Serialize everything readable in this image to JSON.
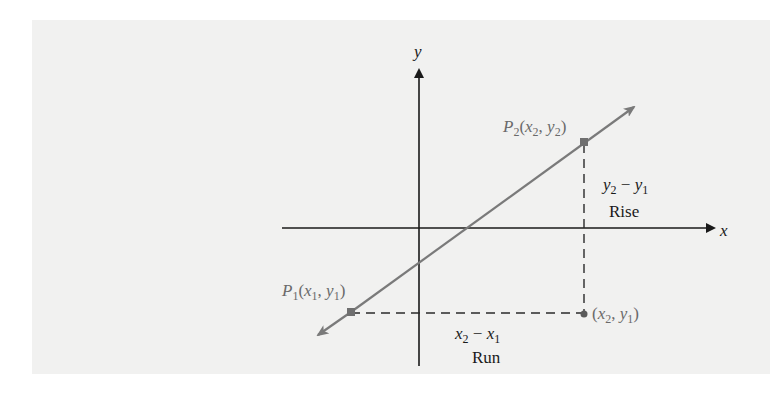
{
  "diagram": {
    "background_color": "#f1f1f0",
    "line_color": "#7a7a7a",
    "axes": {
      "x_label": "x",
      "y_label": "y"
    },
    "points": {
      "p1": {
        "label_main": "P",
        "label_sub": "1",
        "coords_text": "(x",
        "coord1_sub": "1",
        "sep": ", y",
        "coord2_sub": "1",
        "close": ")"
      },
      "p2": {
        "label_main": "P",
        "label_sub": "2",
        "coords_text": "(x",
        "coord1_sub": "2",
        "sep": ", y",
        "coord2_sub": "2",
        "close": ")"
      },
      "corner": {
        "coords_text": "(x",
        "coord1_sub": "2",
        "sep": ", y",
        "coord2_sub": "1",
        "close": ")"
      }
    },
    "rise": {
      "expr_a": "y",
      "expr_a_sub": "2",
      "minus": " − ",
      "expr_b": "y",
      "expr_b_sub": "1",
      "label": "Rise"
    },
    "run": {
      "expr_a": "x",
      "expr_a_sub": "2",
      "minus": " − ",
      "expr_b": "x",
      "expr_b_sub": "1",
      "label": "Run"
    }
  }
}
